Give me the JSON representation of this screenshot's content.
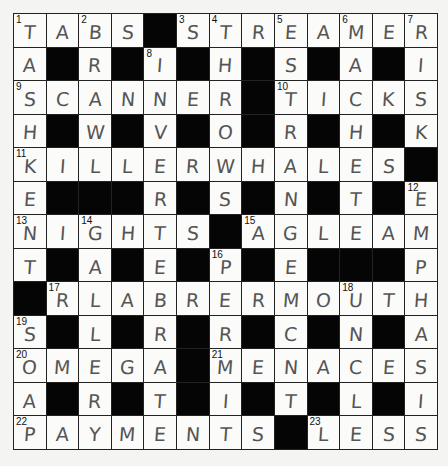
{
  "puzzle": {
    "rows": 13,
    "cols": 13,
    "grid": [
      [
        "T",
        "A",
        "B",
        "S",
        "#",
        "S",
        "T",
        "R",
        "E",
        "A",
        "M",
        "E",
        "R"
      ],
      [
        "A",
        "#",
        "R",
        "#",
        "I",
        "#",
        "H",
        "#",
        "S",
        "#",
        "A",
        "#",
        "I"
      ],
      [
        "S",
        "C",
        "A",
        "N",
        "N",
        "E",
        "R",
        "#",
        "T",
        "I",
        "C",
        "K",
        "S"
      ],
      [
        "H",
        "#",
        "W",
        "#",
        "V",
        "#",
        "O",
        "#",
        "R",
        "#",
        "H",
        "#",
        "K"
      ],
      [
        "K",
        "I",
        "L",
        "L",
        "E",
        "R",
        "W",
        "H",
        "A",
        "L",
        "E",
        "S",
        "#"
      ],
      [
        "E",
        "#",
        "#",
        "#",
        "R",
        "#",
        "S",
        "#",
        "N",
        "#",
        "T",
        "#",
        "E"
      ],
      [
        "N",
        "I",
        "G",
        "H",
        "T",
        "S",
        "#",
        "A",
        "G",
        "L",
        "E",
        "A",
        "M"
      ],
      [
        "T",
        "#",
        "A",
        "#",
        "E",
        "#",
        "P",
        "#",
        "E",
        "#",
        "#",
        "#",
        "P"
      ],
      [
        "#",
        "R",
        "L",
        "A",
        "B",
        "R",
        "E",
        "R",
        "M",
        "O",
        "U",
        "T",
        "H"
      ],
      [
        "S",
        "#",
        "L",
        "#",
        "R",
        "#",
        "R",
        "#",
        "C",
        "#",
        "N",
        "#",
        "A"
      ],
      [
        "O",
        "M",
        "E",
        "G",
        "A",
        "#",
        "M",
        "E",
        "N",
        "A",
        "C",
        "E",
        "S"
      ],
      [
        "A",
        "#",
        "R",
        "#",
        "T",
        "#",
        "I",
        "#",
        "T",
        "#",
        "L",
        "#",
        "I"
      ],
      [
        "P",
        "A",
        "Y",
        "M",
        "E",
        "N",
        "T",
        "S",
        "#",
        "L",
        "E",
        "S",
        "S"
      ]
    ],
    "numbers": [
      {
        "row": 0,
        "col": 0,
        "n": "1"
      },
      {
        "row": 0,
        "col": 2,
        "n": "2"
      },
      {
        "row": 0,
        "col": 5,
        "n": "3"
      },
      {
        "row": 0,
        "col": 6,
        "n": "4"
      },
      {
        "row": 0,
        "col": 8,
        "n": "5"
      },
      {
        "row": 0,
        "col": 10,
        "n": "6"
      },
      {
        "row": 0,
        "col": 12,
        "n": "7"
      },
      {
        "row": 1,
        "col": 4,
        "n": "8"
      },
      {
        "row": 2,
        "col": 0,
        "n": "9"
      },
      {
        "row": 2,
        "col": 8,
        "n": "10"
      },
      {
        "row": 4,
        "col": 0,
        "n": "11"
      },
      {
        "row": 5,
        "col": 12,
        "n": "12"
      },
      {
        "row": 6,
        "col": 0,
        "n": "13"
      },
      {
        "row": 6,
        "col": 2,
        "n": "14"
      },
      {
        "row": 6,
        "col": 7,
        "n": "15"
      },
      {
        "row": 7,
        "col": 6,
        "n": "16"
      },
      {
        "row": 8,
        "col": 1,
        "n": "17"
      },
      {
        "row": 8,
        "col": 10,
        "n": "18"
      },
      {
        "row": 9,
        "col": 0,
        "n": "19"
      },
      {
        "row": 10,
        "col": 0,
        "n": "20"
      },
      {
        "row": 10,
        "col": 6,
        "n": "21"
      },
      {
        "row": 12,
        "col": 0,
        "n": "22"
      },
      {
        "row": 12,
        "col": 9,
        "n": "23"
      }
    ]
  }
}
